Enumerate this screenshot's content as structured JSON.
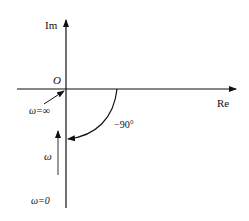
{
  "diagram": {
    "type": "nyquist-plot",
    "axes": {
      "imaginary_label": "Im",
      "real_label": "Re",
      "origin_label": "O"
    },
    "annotations": {
      "omega_infinity": "ω=∞",
      "omega_zero": "ω=0",
      "omega_direction": "ω",
      "angle": "−90°"
    },
    "colors": {
      "line": "#111111",
      "arrow_gray": "#555555"
    }
  }
}
